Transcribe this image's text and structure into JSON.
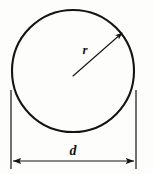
{
  "figure": {
    "kind": "geometry-diagram",
    "background_color": "#fdfdfc",
    "stroke_color": "#141414",
    "width": 153,
    "height": 174
  },
  "circle": {
    "name": "circle-outline",
    "center_x": 73,
    "center_y": 71,
    "radius": 61,
    "stroke_width": 2.1,
    "fill": "none",
    "stroke_color": "#141414"
  },
  "radius_annotation": {
    "label": "r",
    "label_x": 85,
    "label_y": 54,
    "label_font_size": 13,
    "line_from_x": 73,
    "line_from_y": 76,
    "line_to_x": 122,
    "line_to_y": 33,
    "stroke_width": 1.1,
    "arrowhead": "filled-triangle"
  },
  "diameter_annotation": {
    "label": "d",
    "label_x": 73,
    "label_y": 155,
    "label_font_size": 14,
    "dimension_line_y": 161,
    "dimension_line_from_x": 13,
    "dimension_line_to_x": 134,
    "stroke_width": 1.2,
    "arrowheads": "both-ends",
    "extension_line_left_x": 11,
    "extension_line_right_x": 136,
    "extension_line_top_y": 90,
    "extension_line_bottom_y": 169
  }
}
